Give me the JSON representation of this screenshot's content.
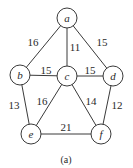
{
  "diagram": {
    "type": "weighted-undirected-graph",
    "caption": "(a)",
    "caption_pos": {
      "x": 66,
      "y": 159
    },
    "node_radius": 10,
    "colors": {
      "stroke": "#3a3a3a",
      "text": "#2a2a2a",
      "background": "#ffffff"
    },
    "nodes": [
      {
        "id": "a",
        "label": "a",
        "x": 67,
        "y": 18
      },
      {
        "id": "b",
        "label": "b",
        "x": 20,
        "y": 75
      },
      {
        "id": "c",
        "label": "c",
        "x": 67,
        "y": 76
      },
      {
        "id": "d",
        "label": "d",
        "x": 113,
        "y": 76
      },
      {
        "id": "e",
        "label": "e",
        "x": 31,
        "y": 134
      },
      {
        "id": "f",
        "label": "f",
        "x": 101,
        "y": 134
      }
    ],
    "edges": [
      {
        "from": "a",
        "to": "b",
        "weight": "16",
        "label_x": 33,
        "label_y": 42
      },
      {
        "from": "a",
        "to": "c",
        "weight": "11",
        "label_x": 75,
        "label_y": 47
      },
      {
        "from": "a",
        "to": "d",
        "weight": "15",
        "label_x": 102,
        "label_y": 42
      },
      {
        "from": "b",
        "to": "c",
        "weight": "15",
        "label_x": 46,
        "label_y": 70
      },
      {
        "from": "c",
        "to": "d",
        "weight": "15",
        "label_x": 90,
        "label_y": 70
      },
      {
        "from": "b",
        "to": "e",
        "weight": "13",
        "label_x": 14,
        "label_y": 105
      },
      {
        "from": "c",
        "to": "e",
        "weight": "16",
        "label_x": 42,
        "label_y": 101
      },
      {
        "from": "c",
        "to": "f",
        "weight": "14",
        "label_x": 91,
        "label_y": 101
      },
      {
        "from": "d",
        "to": "f",
        "weight": "12",
        "label_x": 117,
        "label_y": 105
      },
      {
        "from": "e",
        "to": "f",
        "weight": "21",
        "label_x": 66,
        "label_y": 127
      }
    ]
  }
}
